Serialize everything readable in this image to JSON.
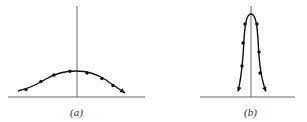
{
  "figure": {
    "panels": [
      {
        "id": "a",
        "label": "(a)",
        "description": "Broad, low bell-shaped curve with dots along it, centered on the vertical axis",
        "shape": "wide-gaussian",
        "relative_peak_height": 0.3,
        "relative_width": "wide",
        "marker_count": 7
      },
      {
        "id": "b",
        "label": "(b)",
        "description": "Narrow, tall peaked curve with dots along both branches, centered on the vertical axis",
        "shape": "narrow-peak",
        "relative_peak_height": 0.95,
        "relative_width": "narrow",
        "marker_count": 6
      }
    ]
  }
}
